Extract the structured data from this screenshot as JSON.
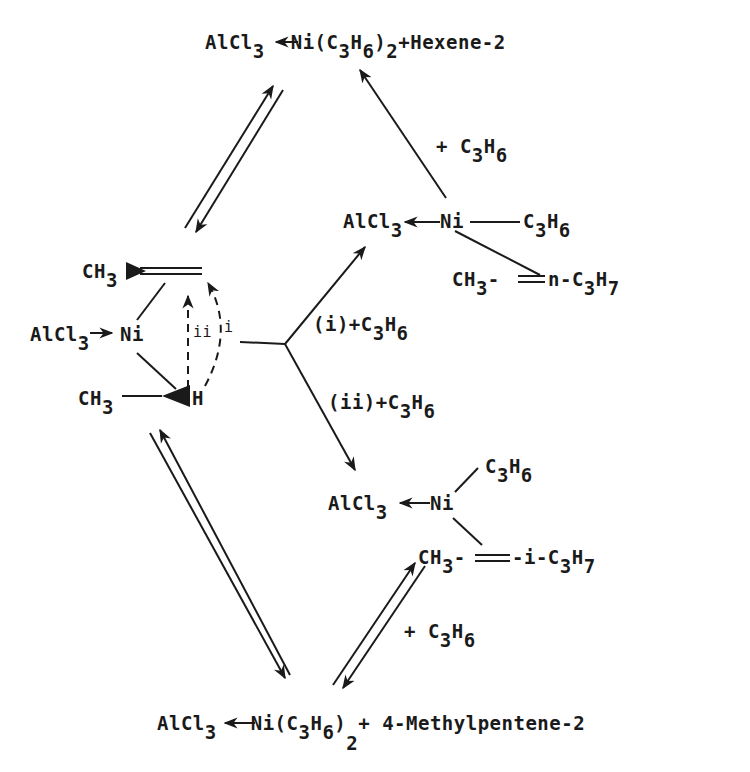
{
  "diagram": {
    "type": "reaction-scheme",
    "ink_color": "#1a1a1a",
    "background": "#ffffff",
    "species": {
      "top_product": {
        "left": "AlCl",
        "sub1": "3",
        "mid": "Ni(C",
        "sub2": "3",
        "h": "H",
        "sub3": "6",
        "close": ")",
        "sub4": "2",
        "tail": "+Hexene-2"
      },
      "center_complex": {
        "top_alkene": {
          "text": "CH",
          "sub": "3"
        },
        "alcl3": {
          "text": "AlCl",
          "sub": "3"
        },
        "ni": "Ni",
        "bottom": {
          "text": "CH",
          "sub": "3"
        },
        "hydride": "H",
        "path_ii": "ii",
        "path_i": "i"
      },
      "upper_right_complex": {
        "alcl3": {
          "text": "AlCl",
          "sub": "3"
        },
        "ni": "Ni",
        "ligand": {
          "c": "C",
          "sub1": "3",
          "h": "H",
          "sub2": "6"
        },
        "olefin": {
          "left": "CH",
          "sub1": "3",
          "mid": "-",
          "right": "n-C",
          "sub2": "3",
          "h": "H",
          "sub3": "7"
        }
      },
      "lower_right_complex": {
        "alcl3": {
          "text": "AlCl",
          "sub": "3"
        },
        "ni": "Ni",
        "ligand": {
          "c": "C",
          "sub1": "3",
          "h": "H",
          "sub2": "6"
        },
        "olefin": {
          "left": "CH",
          "sub1": "3",
          "mid": "-",
          "right": "-i-C",
          "sub2": "3",
          "h": "H",
          "sub3": "7"
        }
      },
      "bottom_product": {
        "left": "AlCl",
        "sub1": "3",
        "mid": "Ni(C",
        "sub2": "3",
        "h": "H",
        "sub3": "6",
        "close": ")",
        "sub4": "2",
        "tail": "+ 4-Methylpentene-2"
      }
    },
    "reagents": {
      "upper": {
        "text": "+ C",
        "sub1": "3",
        "h": "H",
        "sub2": "6"
      },
      "lower": {
        "text": "+ C",
        "sub1": "3",
        "h": "H",
        "sub2": "6"
      },
      "branch_i": {
        "text": "(i)+C",
        "sub1": "3",
        "h": "H",
        "sub2": "6"
      },
      "branch_ii": {
        "text": "(ii)+C",
        "sub1": "3",
        "h": "H",
        "sub2": "6"
      }
    }
  }
}
